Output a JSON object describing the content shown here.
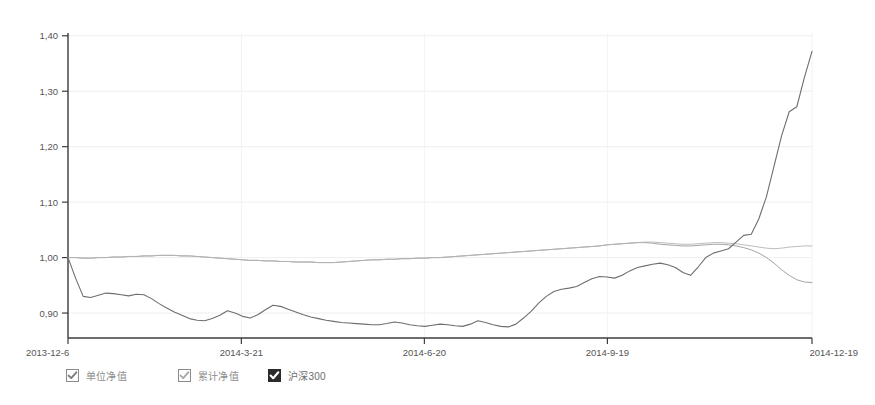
{
  "chart_data": {
    "type": "line",
    "title": "",
    "xlabel": "",
    "ylabel": "",
    "ylim": [
      0.855,
      1.405
    ],
    "yticks": [
      "1,40",
      "1,30",
      "1,20",
      "1,10",
      "1,00",
      "0,90"
    ],
    "ytick_values": [
      1.4,
      1.3,
      1.2,
      1.1,
      1.0,
      0.9
    ],
    "xticks": [
      "2013-12-6",
      "2014-3-21",
      "2014-6-20",
      "2014-9-19",
      "2014-12-19"
    ],
    "xtick_positions": [
      0,
      0.233,
      0.479,
      0.725,
      1.0
    ],
    "grid": "faint",
    "legend_position": "bottom-left",
    "x_start": "2013-12-6",
    "x_end": "2014-12-19",
    "series": [
      {
        "name": "单位净值",
        "color": "#9a9a9a",
        "values": [
          1.0,
          1.0,
          0.999,
          0.999,
          1.0,
          1.0,
          1.001,
          1.001,
          1.002,
          1.002,
          1.003,
          1.003,
          1.004,
          1.004,
          1.004,
          1.003,
          1.003,
          1.002,
          1.001,
          1.0,
          0.999,
          0.998,
          0.997,
          0.996,
          0.995,
          0.995,
          0.994,
          0.994,
          0.993,
          0.993,
          0.992,
          0.992,
          0.992,
          0.991,
          0.991,
          0.991,
          0.992,
          0.993,
          0.994,
          0.995,
          0.996,
          0.996,
          0.997,
          0.997,
          0.998,
          0.998,
          0.999,
          0.999,
          1.0,
          1.0,
          1.001,
          1.002,
          1.003,
          1.004,
          1.005,
          1.006,
          1.007,
          1.008,
          1.009,
          1.01,
          1.011,
          1.012,
          1.013,
          1.014,
          1.015,
          1.016,
          1.017,
          1.018,
          1.019,
          1.02,
          1.021,
          1.023,
          1.024,
          1.025,
          1.026,
          1.027,
          1.027,
          1.026,
          1.024,
          1.023,
          1.022,
          1.021,
          1.021,
          1.022,
          1.023,
          1.024,
          1.024,
          1.023,
          1.021,
          1.018,
          1.014,
          1.008,
          1.0,
          0.99,
          0.978,
          0.968,
          0.96,
          0.956,
          0.955
        ]
      },
      {
        "name": "累计净值",
        "color": "#b4b4b4",
        "values": [
          1.0,
          1.0,
          0.999,
          0.999,
          1.0,
          1.0,
          1.001,
          1.001,
          1.002,
          1.002,
          1.003,
          1.003,
          1.004,
          1.004,
          1.004,
          1.003,
          1.003,
          1.002,
          1.001,
          1.0,
          0.999,
          0.998,
          0.997,
          0.996,
          0.995,
          0.995,
          0.994,
          0.994,
          0.993,
          0.993,
          0.992,
          0.992,
          0.992,
          0.991,
          0.991,
          0.991,
          0.992,
          0.993,
          0.994,
          0.995,
          0.996,
          0.996,
          0.997,
          0.997,
          0.998,
          0.998,
          0.999,
          0.999,
          1.0,
          1.0,
          1.001,
          1.002,
          1.003,
          1.004,
          1.005,
          1.006,
          1.007,
          1.008,
          1.009,
          1.01,
          1.011,
          1.012,
          1.013,
          1.014,
          1.015,
          1.016,
          1.017,
          1.018,
          1.019,
          1.02,
          1.021,
          1.023,
          1.024,
          1.025,
          1.026,
          1.027,
          1.028,
          1.028,
          1.027,
          1.026,
          1.025,
          1.024,
          1.024,
          1.025,
          1.026,
          1.027,
          1.027,
          1.026,
          1.025,
          1.023,
          1.021,
          1.019,
          1.017,
          1.016,
          1.017,
          1.019,
          1.02,
          1.021,
          1.021
        ]
      },
      {
        "name": "沪深300",
        "color": "#6e6e6e",
        "values": [
          1.0,
          0.963,
          0.93,
          0.928,
          0.932,
          0.936,
          0.935,
          0.933,
          0.931,
          0.934,
          0.933,
          0.926,
          0.917,
          0.909,
          0.902,
          0.896,
          0.89,
          0.887,
          0.886,
          0.89,
          0.896,
          0.904,
          0.9,
          0.894,
          0.891,
          0.897,
          0.906,
          0.914,
          0.912,
          0.907,
          0.902,
          0.897,
          0.893,
          0.89,
          0.887,
          0.885,
          0.883,
          0.882,
          0.881,
          0.88,
          0.879,
          0.879,
          0.881,
          0.884,
          0.882,
          0.879,
          0.877,
          0.876,
          0.878,
          0.88,
          0.879,
          0.877,
          0.876,
          0.88,
          0.886,
          0.883,
          0.879,
          0.876,
          0.875,
          0.88,
          0.891,
          0.903,
          0.918,
          0.93,
          0.939,
          0.943,
          0.945,
          0.948,
          0.955,
          0.962,
          0.966,
          0.965,
          0.963,
          0.968,
          0.976,
          0.982,
          0.985,
          0.988,
          0.99,
          0.987,
          0.982,
          0.973,
          0.968,
          0.983,
          1.0,
          1.008,
          1.012,
          1.016,
          1.028,
          1.04,
          1.042,
          1.07,
          1.11,
          1.165,
          1.22,
          1.263,
          1.272,
          1.325,
          1.372
        ]
      }
    ]
  },
  "legend": {
    "items": [
      {
        "label": "单位净值",
        "checked": true,
        "style": "light"
      },
      {
        "label": "累计净值",
        "checked": true,
        "style": "light"
      },
      {
        "label": "沪深300",
        "checked": true,
        "style": "dark"
      }
    ]
  }
}
